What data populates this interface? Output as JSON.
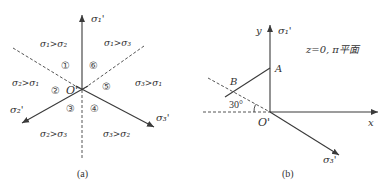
{
  "figure_a": {
    "caption": "(a)",
    "origin_label": "O'",
    "axes": {
      "sigma1": "σ₁'",
      "sigma2": "σ₂'",
      "sigma3": "σ₃'"
    },
    "regions": [
      {
        "id": "1",
        "symbol": "①"
      },
      {
        "id": "2",
        "symbol": "②"
      },
      {
        "id": "3",
        "symbol": "③"
      },
      {
        "id": "4",
        "symbol": "④"
      },
      {
        "id": "5",
        "symbol": "⑤"
      },
      {
        "id": "6",
        "symbol": "⑥"
      }
    ],
    "inequalities": {
      "upper_left": "σ₁>σ₂",
      "upper_right": "σ₁>σ₃",
      "left": "σ₂>σ₁",
      "right": "σ₃>σ₁",
      "lower_left": "σ₂>σ₃",
      "lower_right": "σ₃>σ₂"
    }
  },
  "figure_b": {
    "caption": "(b)",
    "origin_label": "O'",
    "y_label": "y",
    "x_label": "x",
    "sigma1": "σ₁'",
    "sigma3": "σ₃'",
    "point_a": "A",
    "point_b": "B",
    "angle": "30°",
    "plane_note": "z=0, π平面"
  },
  "colors": {
    "line": "#3a3a3a",
    "dashed": "#555555",
    "text": "#333333"
  }
}
